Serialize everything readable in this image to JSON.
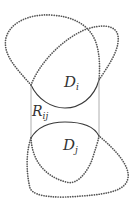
{
  "diagram": {
    "labels": {
      "upper_region": {
        "main": "D",
        "sub": "i"
      },
      "lower_region": {
        "main": "D",
        "sub": "j"
      },
      "middle_region": {
        "main": "R",
        "sub": "ij"
      }
    },
    "colors": {
      "background": "#ffffff",
      "dotted_curve": "#555555",
      "solid_arc": "#3a3a3a",
      "connector_lines": "#9a9a9a",
      "text": "#333333"
    }
  }
}
